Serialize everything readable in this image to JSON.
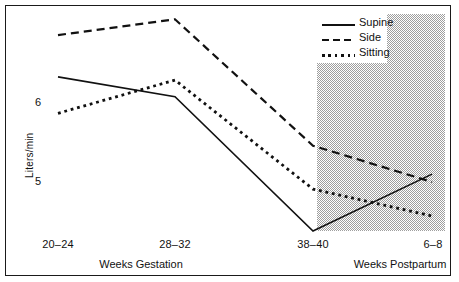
{
  "chart_data": {
    "type": "line",
    "title": "",
    "subtitle": "",
    "xlabel": "",
    "ylabel": "Liters/min",
    "categories": [
      "20–24",
      "28–32",
      "38–40",
      "6–8"
    ],
    "x_group_labels": [
      "Weeks Gestation",
      "Weeks Postpartum"
    ],
    "y_ticks": [
      "6",
      "5"
    ],
    "y_tick_values": [
      6,
      5
    ],
    "ylim": [
      4.2,
      7.25
    ],
    "grid": false,
    "legend_position": "top-right",
    "shaded_region": {
      "label": "postpartum",
      "from_category": "38–40",
      "to_category": "6–8",
      "color": "#c8c8c8"
    },
    "series": [
      {
        "name": "Supine",
        "style": "solid",
        "color": "#111111",
        "values": [
          6.33,
          6.08,
          4.38,
          5.1
        ]
      },
      {
        "name": "Side",
        "style": "dashed",
        "color": "#111111",
        "values": [
          6.86,
          7.06,
          5.46,
          5.0
        ]
      },
      {
        "name": "Sitting",
        "style": "dotted",
        "color": "#111111",
        "values": [
          5.87,
          6.29,
          4.91,
          4.57
        ]
      }
    ]
  },
  "legend": {
    "items": [
      {
        "label": "Supine",
        "style": "solid"
      },
      {
        "label": "Side",
        "style": "dashed"
      },
      {
        "label": "Sitting",
        "style": "dotted"
      }
    ]
  },
  "axes": {
    "y_label": "Liters/min",
    "y_tick_top": "6",
    "y_tick_bottom": "5",
    "x_ticks": [
      "20–24",
      "28–32",
      "38–40",
      "6–8"
    ],
    "x_group_left": "Weeks Gestation",
    "x_group_right": "Weeks Postpartum"
  },
  "colors": {
    "line": "#111111",
    "shade": "#c8c8c8",
    "frame": "#1a1a1a",
    "background": "#ffffff"
  }
}
